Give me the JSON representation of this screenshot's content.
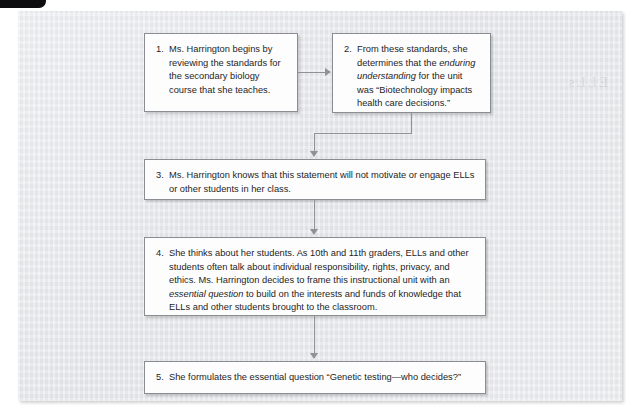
{
  "figure": {
    "background_color": "#e8e9ed",
    "box_border_color": "#8a8d92",
    "connector_color": "#8e9196",
    "ghost_text": "ELLs",
    "steps": [
      {
        "number": "1.",
        "text_parts": [
          {
            "style": "normal",
            "text": "Ms. Harrington begins by reviewing the standards for the secondary biology course that she teaches."
          }
        ]
      },
      {
        "number": "2.",
        "text_parts": [
          {
            "style": "normal",
            "text": "From these standards, she determines that the "
          },
          {
            "style": "italic",
            "text": "enduring understanding"
          },
          {
            "style": "normal",
            "text": " for the unit was “Biotechnology impacts health care decisions.”"
          }
        ]
      },
      {
        "number": "3.",
        "text_parts": [
          {
            "style": "normal",
            "text": "Ms. Harrington knows that this statement will not motivate or engage ELLs or other students in her class."
          }
        ]
      },
      {
        "number": "4.",
        "text_parts": [
          {
            "style": "normal",
            "text": "She thinks about her students. As 10th and 11th graders, ELLs and other students often talk about individual responsibility, rights, privacy, and ethics. Ms. Harrington decides to frame this instructional unit with an "
          },
          {
            "style": "italic",
            "text": "essential question"
          },
          {
            "style": "normal",
            "text": " to build on the interests and funds of knowledge that ELLs and other students brought to the classroom."
          }
        ]
      },
      {
        "number": "5.",
        "text_parts": [
          {
            "style": "normal",
            "text": "She formulates the essential question “Genetic testing—who decides?”"
          }
        ]
      }
    ]
  }
}
